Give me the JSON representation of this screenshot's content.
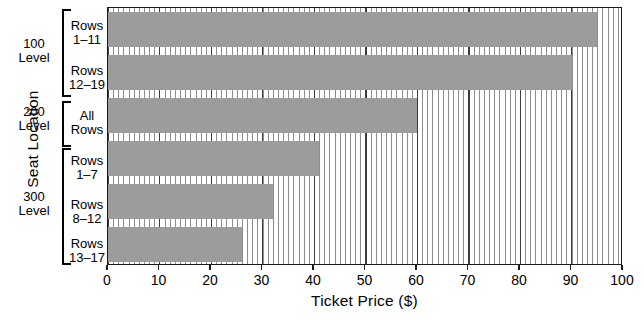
{
  "chart_data": {
    "type": "bar",
    "orientation": "horizontal",
    "title": "",
    "xlabel": "Ticket Price ($)",
    "ylabel": "Seat Location",
    "xlim": [
      0,
      100
    ],
    "xticks": [
      0,
      10,
      20,
      30,
      40,
      50,
      60,
      70,
      80,
      90,
      100
    ],
    "xtick_labels": [
      "0",
      "10",
      "20",
      "30",
      "40",
      "50",
      "60",
      "70",
      "80",
      "90",
      "100"
    ],
    "grid": "vertical-fine-and-major",
    "legend": "none",
    "bar_color": "#9c9c9c",
    "groups": [
      {
        "level": "100",
        "level_line2": "Level"
      },
      {
        "level": "200",
        "level_line2": "Level"
      },
      {
        "level": "300",
        "level_line2": "Level"
      }
    ],
    "categories": [
      {
        "line1": "Rows",
        "line2": "1–11",
        "group": "100 Level"
      },
      {
        "line1": "Rows",
        "line2": "12–19",
        "group": "100 Level"
      },
      {
        "line1": "All",
        "line2": "Rows",
        "group": "200 Level"
      },
      {
        "line1": "Rows",
        "line2": "1–7",
        "group": "300 Level"
      },
      {
        "line1": "Rows",
        "line2": "8–12",
        "group": "300 Level"
      },
      {
        "line1": "Rows",
        "line2": "13–17",
        "group": "300 Level"
      }
    ],
    "values": [
      95,
      90,
      60,
      41,
      32,
      26
    ],
    "series": [
      {
        "name": "Ticket Price ($)",
        "values": [
          95,
          90,
          60,
          41,
          32,
          26
        ]
      }
    ]
  },
  "axes": {
    "y_title": "Seat Location",
    "x_title": "Ticket Price ($)"
  },
  "y_groups": [
    {
      "name": "group-100",
      "line1": "100",
      "line2": "Level"
    },
    {
      "name": "group-200",
      "line1": "200",
      "line2": "Level"
    },
    {
      "name": "group-300",
      "line1": "300",
      "line2": "Level"
    }
  ],
  "y_rows": [
    {
      "line1": "Rows",
      "line2": "1–11"
    },
    {
      "line1": "Rows",
      "line2": "12–19"
    },
    {
      "line1": "All",
      "line2": "Rows"
    },
    {
      "line1": "Rows",
      "line2": "1–7"
    },
    {
      "line1": "Rows",
      "line2": "8–12"
    },
    {
      "line1": "Rows",
      "line2": "13–17"
    }
  ],
  "x_tick_labels": [
    "0",
    "10",
    "20",
    "30",
    "40",
    "50",
    "60",
    "70",
    "80",
    "90",
    "100"
  ]
}
